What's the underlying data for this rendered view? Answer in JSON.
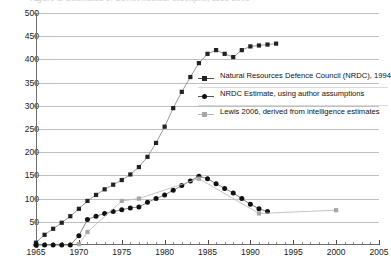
{
  "figure": {
    "title_clipped": "Figure 1. Estimates of Soviet nuclear stockpile, 1965-2005",
    "badge_icon": "figure-bullet-icon"
  },
  "chart_data": {
    "type": "line",
    "title": "",
    "xlabel": "",
    "ylabel": "",
    "xlim": [
      1965,
      2005
    ],
    "ylim": [
      0,
      500
    ],
    "yticks": [
      0,
      50,
      100,
      150,
      200,
      250,
      300,
      350,
      400,
      450,
      500
    ],
    "xticks": [
      1965,
      1970,
      1975,
      1980,
      1985,
      1990,
      1995,
      2000,
      2005
    ],
    "x_minor_step": 1,
    "grid": "horizontal",
    "legend_position": "inside-right",
    "series": [
      {
        "name": "Natural Resources Defence Council (NRDC), 1994",
        "color": "#222222",
        "line_color": "#8c8c8c",
        "marker": "square",
        "x": [
          1965,
          1966,
          1967,
          1968,
          1969,
          1970,
          1971,
          1972,
          1973,
          1974,
          1975,
          1976,
          1977,
          1978,
          1979,
          1980,
          1981,
          1982,
          1983,
          1984,
          1985,
          1986,
          1987,
          1988,
          1989,
          1990,
          1991,
          1992,
          1993
        ],
        "y": [
          5,
          22,
          35,
          48,
          62,
          78,
          95,
          108,
          120,
          130,
          140,
          152,
          168,
          190,
          220,
          255,
          295,
          330,
          362,
          392,
          412,
          420,
          412,
          405,
          420,
          428,
          430,
          432,
          434
        ]
      },
      {
        "name": "NRDC Estimate, using author assumptions",
        "color": "#111111",
        "line_color": "#777777",
        "marker": "circle",
        "x": [
          1965,
          1966,
          1967,
          1968,
          1969,
          1970,
          1971,
          1972,
          1973,
          1974,
          1975,
          1976,
          1977,
          1978,
          1979,
          1980,
          1981,
          1982,
          1983,
          1984,
          1985,
          1986,
          1987,
          1988,
          1989,
          1990,
          1991,
          1992
        ],
        "y": [
          0,
          0,
          0,
          0,
          0,
          20,
          55,
          62,
          68,
          72,
          76,
          80,
          82,
          92,
          100,
          108,
          118,
          128,
          138,
          148,
          143,
          132,
          122,
          112,
          100,
          88,
          78,
          72
        ]
      },
      {
        "name": "Lewis 2006, derived from intelligence estimates",
        "color": "#a6a6a6",
        "line_color": "#bdbdbd",
        "marker": "square",
        "x": [
          1970,
          1971,
          1975,
          1977,
          1984,
          1991,
          2000
        ],
        "y": [
          2,
          28,
          95,
          100,
          143,
          68,
          75
        ]
      }
    ]
  },
  "legend": {
    "items": [
      {
        "label": "Natural Resources Defence Council (NRDC), 1994",
        "marker": "square-dark"
      },
      {
        "label": "NRDC Estimate, using author assumptions",
        "marker": "circle-dark"
      },
      {
        "label": "Lewis 2006, derived from intelligence estimates",
        "marker": "square-gray"
      }
    ]
  }
}
